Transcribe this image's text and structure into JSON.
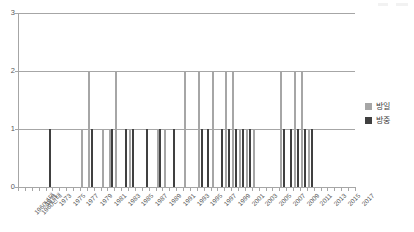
{
  "chart_data": {
    "type": "bar",
    "title": "",
    "subtitle": "",
    "xlabel": "",
    "ylabel": "",
    "ylim": [
      0,
      3
    ],
    "yticks": [
      0,
      1,
      2,
      3
    ],
    "grid": true,
    "legend_position": "right",
    "categories": [
      "1960년대",
      "1960년대",
      "1971",
      "1972",
      "1973",
      "1974",
      "1975",
      "1976",
      "1977",
      "1978",
      "1979",
      "1980",
      "1981",
      "1982",
      "1983",
      "1984",
      "1985",
      "1986",
      "1987",
      "1988",
      "1989",
      "1990",
      "1991",
      "1992",
      "1993",
      "1994",
      "1995",
      "1996",
      "1997",
      "1998",
      "1999",
      "2000",
      "2001",
      "2002",
      "2003",
      "2004",
      "2005",
      "2006",
      "2007",
      "2008",
      "2009",
      "2010",
      "2011",
      "2012",
      "2013",
      "2014",
      "2015",
      "2016",
      "2017"
    ],
    "tick_labels": [
      "1960년대",
      "1960년대",
      "1971",
      "",
      "1973",
      "",
      "1975",
      "",
      "1977",
      "",
      "1979",
      "",
      "1981",
      "",
      "1983",
      "",
      "1985",
      "",
      "1987",
      "",
      "1989",
      "",
      "1991",
      "",
      "1993",
      "",
      "1995",
      "",
      "1997",
      "",
      "1999",
      "",
      "2001",
      "",
      "2003",
      "",
      "2005",
      "",
      "2007",
      "",
      "2009",
      "",
      "2011",
      "",
      "2013",
      "",
      "2015",
      "",
      "2017"
    ],
    "series": [
      {
        "name": "방일",
        "color": "#a6a6a6",
        "values": [
          0,
          0,
          0,
          0,
          0,
          0,
          0,
          0,
          0,
          1,
          2,
          0,
          1,
          1,
          2,
          0,
          1,
          0,
          0,
          0,
          1,
          1,
          0,
          0,
          2,
          0,
          2,
          0,
          2,
          0,
          2,
          2,
          1,
          1,
          1,
          0,
          0,
          0,
          2,
          0,
          2,
          2,
          1,
          0,
          0,
          0,
          0,
          0,
          0
        ]
      },
      {
        "name": "방중",
        "color": "#404040",
        "values": [
          0,
          0,
          0,
          0,
          1,
          0,
          0,
          0,
          0,
          0,
          1,
          0,
          0,
          1,
          0,
          1,
          1,
          0,
          1,
          0,
          1,
          0,
          1,
          0,
          0,
          0,
          1,
          1,
          0,
          1,
          1,
          1,
          1,
          1,
          0,
          0,
          0,
          0,
          1,
          1,
          1,
          1,
          1,
          0,
          0,
          0,
          0,
          0,
          0
        ]
      }
    ]
  },
  "legend": {
    "items": [
      {
        "label": "방일",
        "color": "#a6a6a6"
      },
      {
        "label": "방중",
        "color": "#404040"
      }
    ]
  },
  "colors": {
    "series_bangil": "#a6a6a6",
    "series_bangjung": "#404040",
    "axis": "#a6a6a6",
    "text": "#595959",
    "background": "#ffffff"
  }
}
